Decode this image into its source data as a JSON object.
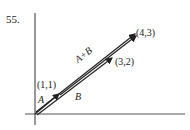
{
  "problem_number": "55.",
  "points": {
    "p11": "(1,1)",
    "p32": "(3,2)",
    "p43": "(4,3)"
  },
  "vectors": {
    "a": "A",
    "b": "B",
    "sum": "A+B"
  },
  "colors": {
    "ink": "#222222"
  }
}
